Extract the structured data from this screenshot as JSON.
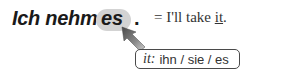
{
  "german_sentence": {
    "prefix": "Ich nehme",
    "highlighted_word": "es",
    "period": "."
  },
  "translation": {
    "equals": "= I'll take ",
    "underlined": "it",
    "end": "."
  },
  "note": {
    "label": "it:",
    "forms": "ihn / sie / es"
  },
  "icons": {
    "arrow": "arrow-up-left-icon"
  },
  "colors": {
    "pill": "#d3d3d3",
    "arrow_dark": "#555555",
    "arrow_light": "#b8b8b8",
    "text": "#1a1a1a",
    "box_border": "#4a4a4a"
  }
}
